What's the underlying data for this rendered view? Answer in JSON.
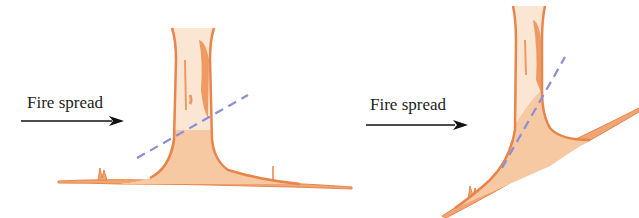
{
  "figure": {
    "panels": [
      {
        "id": "flat-ground",
        "label": "Fire spread",
        "arrow_direction": "right"
      },
      {
        "id": "slope-ground",
        "label": "Fire spread",
        "arrow_direction": "right"
      }
    ],
    "colors": {
      "trunk_stroke": "#e8854a",
      "trunk_fill": "#f7c9a3",
      "trunk_light": "#fbe6d4",
      "dashed_line": "#8a8fd8",
      "arrow": "#111111",
      "text": "#222222"
    }
  }
}
